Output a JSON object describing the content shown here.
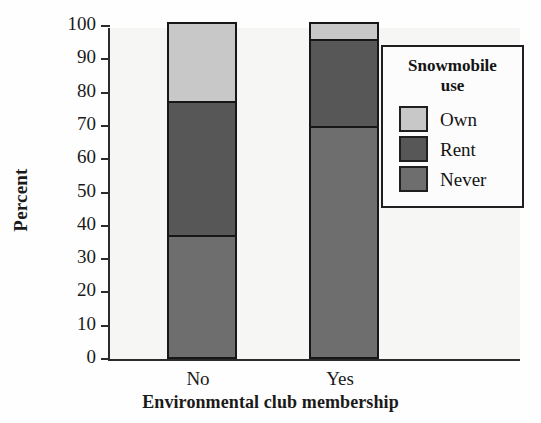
{
  "chart_data": {
    "type": "bar",
    "subtype": "stacked-100-percent",
    "title": "",
    "xlabel": "Environmental club membership",
    "ylabel": "Percent",
    "categories": [
      "No",
      "Yes"
    ],
    "ylim": [
      0,
      100
    ],
    "yticks": [
      0,
      10,
      20,
      30,
      40,
      50,
      60,
      70,
      80,
      90,
      100
    ],
    "ytick_labels": [
      "0",
      "10",
      "20",
      "30",
      "40",
      "50",
      "60",
      "70",
      "80",
      "90",
      "100"
    ],
    "grid": false,
    "legend_position": "right-inside",
    "legend_title": "Snowmobile use",
    "stack_order_bottom_to_top": [
      "Never",
      "Rent",
      "Own"
    ],
    "series": [
      {
        "name": "Never",
        "values": [
          36.5,
          69.5
        ],
        "color": "#6e6e6e"
      },
      {
        "name": "Rent",
        "values": [
          40.5,
          26.0
        ],
        "color": "#575757"
      },
      {
        "name": "Own",
        "values": [
          23.0,
          4.5
        ],
        "color": "#c8c8c8"
      }
    ],
    "cumulative_tops": {
      "No": {
        "Never": 36.5,
        "Rent": 77.0,
        "Own": 100.0
      },
      "Yes": {
        "Never": 69.5,
        "Rent": 95.5,
        "Own": 100.0
      }
    }
  },
  "legend": {
    "title_line1": "Snowmobile",
    "title_line2": "use",
    "entries": [
      {
        "label": "Own",
        "color": "#c8c8c8"
      },
      {
        "label": "Rent",
        "color": "#575757"
      },
      {
        "label": "Never",
        "color": "#6e6e6e"
      }
    ]
  },
  "axes": {
    "y_title": "Percent",
    "x_title": "Environmental club membership"
  },
  "colors": {
    "axis": "#2b2b2b",
    "bar_outline": "#171717",
    "plot_background": "#f6f6f4",
    "text": "#1a1a1a"
  }
}
